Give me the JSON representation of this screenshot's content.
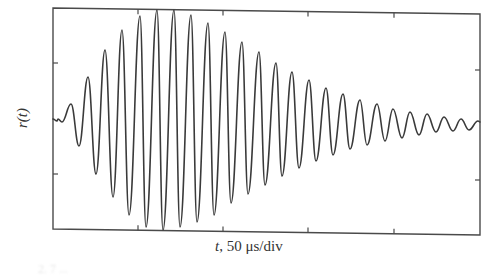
{
  "chart_data": {
    "type": "line",
    "title": "",
    "xlabel_var": "t",
    "xlabel_rest": ", 50 μs/div",
    "xlabel": "t, 50 μs/div",
    "ylabel": "r(t)",
    "x_units": "μs",
    "x_per_div": 50,
    "x_divisions": 5,
    "x_range_us": [
      0,
      250
    ],
    "y_divisions": 4,
    "y_tick_labels": [],
    "x_tick_labels": [],
    "grid": false,
    "legend": null,
    "series": [
      {
        "name": "r(t)",
        "color": "#3a3a3a",
        "extrema_time_us": [
          2.3,
          5.3,
          7.9,
          10.3,
          12.9,
          15.2,
          18.0,
          20.1,
          23.1,
          25.0,
          28.0,
          30.0,
          33.2,
          35.0,
          38.0,
          40.0,
          43.0,
          45.0,
          48.0,
          50.0,
          53.0,
          55.0,
          58.0,
          60.0,
          63.0,
          65.0,
          68.0,
          70.0,
          73.0,
          75.0,
          78.0,
          80.0,
          83.0,
          85.0,
          88.0,
          90.0,
          93.0,
          94.6,
          98.0,
          100.0,
          103.0,
          104.6,
          108.0,
          110.0,
          113.0,
          114.5,
          118.0,
          120.0,
          123.0,
          124.5,
          127.5,
          129.5,
          133.0,
          134.5,
          137.5,
          139.5,
          142.5,
          144.5,
          147.5,
          149.0,
          152.5,
          154.5,
          157.5,
          159.0,
          162.5,
          164.5,
          167.5,
          169.0,
          172.5,
          174.5,
          177.5,
          179.0,
          182.5,
          184.5,
          187.5,
          189.0,
          192.5,
          194.5,
          197.5,
          199.0,
          202.5,
          204.5,
          207.5,
          209.5,
          212.5,
          214.0,
          217.5,
          219.5,
          222.5,
          224.0,
          227.5,
          229.5,
          232.5,
          234.0,
          237.5,
          239.5,
          242.5,
          244.0,
          247.5,
          249.5
        ],
        "extrema_value_div": [
          0.0,
          -0.06,
          0.29,
          -0.49,
          0.76,
          -0.96,
          1.22,
          -1.41,
          1.67,
          -1.91,
          1.9,
          -1.98,
          1.98,
          -1.92,
          1.88,
          -1.8,
          1.7,
          -1.58,
          1.52,
          -1.43,
          1.35,
          -1.3,
          1.21,
          -1.16,
          1.09,
          -1.02,
          0.96,
          -0.9,
          0.83,
          -0.79,
          0.74,
          -0.7,
          0.66,
          -0.63,
          0.59,
          -0.56,
          0.52,
          -0.49,
          0.47,
          -0.44,
          0.42,
          -0.4,
          0.38,
          -0.36,
          0.34,
          -0.33,
          0.31,
          -0.3,
          0.28,
          -0.27,
          0.26,
          -0.25,
          0.23,
          -0.22,
          0.21,
          -0.2,
          0.19,
          -0.19,
          0.18,
          -0.17,
          0.16,
          -0.16,
          0.15,
          -0.14,
          0.14,
          -0.13,
          0.12,
          -0.12,
          0.11,
          -0.11,
          0.11,
          -0.1,
          0.1,
          -0.1,
          0.09,
          -0.09,
          0.09,
          -0.08,
          0.08,
          -0.08,
          0.07,
          -0.07,
          0.07,
          -0.07,
          0.06,
          -0.06,
          0.06,
          -0.06,
          0.06,
          -0.05,
          0.05,
          -0.05,
          0.05,
          -0.05,
          0.05,
          -0.04,
          0.04,
          -0.04,
          0.04,
          0.0
        ],
        "peaks_px": [
          [
            71,
            104
          ],
          [
            88,
            77
          ],
          [
            105,
            50
          ],
          [
            122,
            30
          ],
          [
            140,
            16
          ],
          [
            157,
            10
          ],
          [
            174,
            10
          ],
          [
            191,
            15
          ],
          [
            208,
            23
          ],
          [
            225,
            32
          ],
          [
            242,
            42
          ],
          [
            259,
            52
          ],
          [
            276,
            63
          ],
          [
            292,
            72
          ],
          [
            309,
            80
          ],
          [
            326,
            88
          ],
          [
            343,
            94
          ],
          [
            360,
            100
          ],
          [
            377,
            104
          ],
          [
            393,
            109
          ],
          [
            410,
            112
          ],
          [
            427,
            114
          ],
          [
            444,
            117
          ],
          [
            461,
            119
          ],
          [
            478,
            121
          ]
        ],
        "troughs_px": [
          [
            62,
            122
          ],
          [
            79,
            146
          ],
          [
            96,
            174
          ],
          [
            113,
            197
          ],
          [
            129,
            215
          ],
          [
            146,
            227
          ],
          [
            163,
            230
          ],
          [
            180,
            227
          ],
          [
            197,
            222
          ],
          [
            214,
            215
          ],
          [
            231,
            203
          ],
          [
            248,
            194
          ],
          [
            265,
            185
          ],
          [
            282,
            176
          ],
          [
            299,
            168
          ],
          [
            316,
            161
          ],
          [
            333,
            155
          ],
          [
            350,
            149
          ],
          [
            367,
            145
          ],
          [
            385,
            141
          ],
          [
            402,
            138
          ],
          [
            419,
            135
          ],
          [
            436,
            132
          ],
          [
            453,
            131
          ],
          [
            469,
            130
          ]
        ]
      }
    ]
  },
  "plot_frame": {
    "left": 53,
    "right": 480,
    "top_left_y": 8,
    "top_right_y": 14,
    "bottom_left_y": 229,
    "bottom_right_y": 235,
    "x_tick_px": [
      138,
      223,
      308,
      394
    ],
    "y_tick_px": [
      63,
      174
    ],
    "y_tick_px_right": [
      70,
      180
    ],
    "start_point_px": [
      53,
      119
    ],
    "end_point_px": [
      480,
      122
    ],
    "line_color": "#3a3a3a",
    "frame_color": "#4a4a4a"
  },
  "labels": {
    "y_axis": "r(t)",
    "x_axis_var": "t",
    "x_axis_rest": ", 50 μs/div",
    "caption_fragment": "2. 7 ..."
  }
}
